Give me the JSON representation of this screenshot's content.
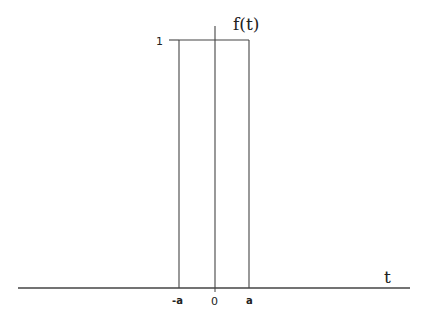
{
  "diagram": {
    "function_label": "f(t)",
    "axis_label_t": "t",
    "y_tick_label": "1",
    "x_tick_labels": {
      "neg_a": "-a",
      "zero": "0",
      "pos_a": "a"
    },
    "colors": {
      "line": "#444444",
      "text": "#222222",
      "background": "#ffffff"
    }
  }
}
